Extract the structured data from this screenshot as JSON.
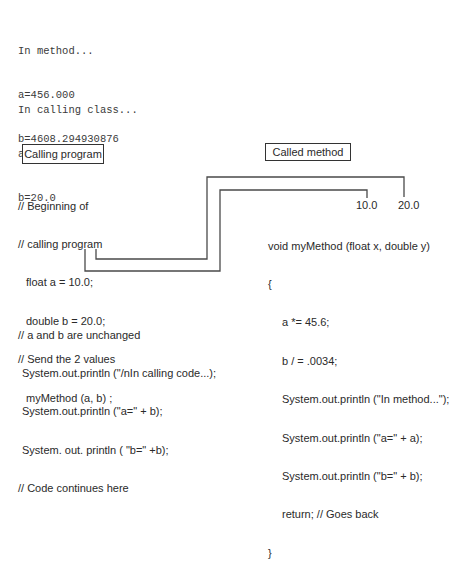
{
  "console_output": {
    "method_block": {
      "lines": [
        "In method...",
        "a=456.000",
        "b=4608.294930876"
      ]
    },
    "calling_block": {
      "lines": [
        "In calling class...",
        "a=10.0",
        "b=20.0"
      ]
    }
  },
  "calling_program": {
    "title": "Calling program",
    "code_lines": [
      "// Beginning of",
      "// calling program",
      "float a = 10.0;",
      "double b = 20.0;",
      "// Send the 2 values",
      "myMethod (a, b) ;"
    ],
    "after_lines": [
      "// a and b are unchanged",
      "System.out.println (\"/nIn calling code...);",
      "System.out.println (\"a=\" + b);",
      "System. out. println ( \"b=\" +b);",
      "// Code continues here"
    ]
  },
  "called_method": {
    "title": "Called method",
    "passed_values": [
      "10.0",
      "20.0"
    ],
    "code_lines": [
      "void myMethod (float x, double y)",
      "{",
      "a *= 45.6;",
      "b / = .0034;",
      "System.out.println (\"In method...\");",
      "System.out.println (\"a=\" + a);",
      "System.out.println (\"b=\" + b);",
      "return; // Goes back",
      "}"
    ]
  },
  "colors": {
    "line": "#4a4a4a",
    "text": "#2a2a2a",
    "background": "#ffffff"
  }
}
